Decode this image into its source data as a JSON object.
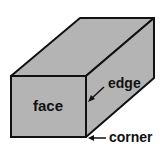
{
  "diagram": {
    "labels": {
      "face": "face",
      "edge": "edge",
      "corner": "corner"
    },
    "colors": {
      "fill": "#b4b4b4",
      "stroke": "#111111",
      "background": "#ffffff"
    }
  }
}
